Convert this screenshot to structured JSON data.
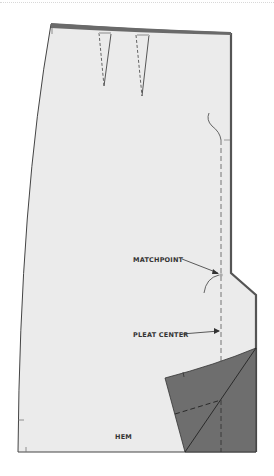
{
  "diagram": {
    "type": "sewing-pattern",
    "labels": {
      "matchpoint": "MATCHPOINT",
      "pleat_center": "PLEAT CENTER",
      "hem": "HEM"
    },
    "colors": {
      "pattern_fill": "#ebebeb",
      "pleat_fill": "#6e6e6e",
      "waistband": "#6a6a6a",
      "outline": "#444444",
      "right_edge": "#555555"
    },
    "elements": [
      "waistband",
      "two darts",
      "pleat center dashed line",
      "matchpoint notch",
      "pleat underlay flap",
      "hem line"
    ]
  }
}
